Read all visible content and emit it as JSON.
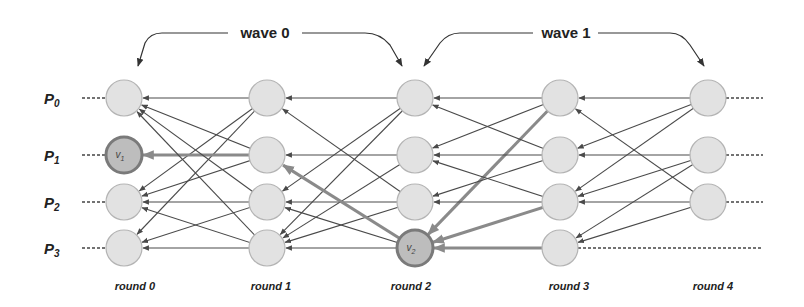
{
  "waves": [
    {
      "label": "wave 0",
      "from_round": 0,
      "to_round": 2
    },
    {
      "label": "wave 1",
      "from_round": 2,
      "to_round": 4
    }
  ],
  "processes": [
    {
      "label": "P",
      "sub": "0"
    },
    {
      "label": "P",
      "sub": "1"
    },
    {
      "label": "P",
      "sub": "2"
    },
    {
      "label": "P",
      "sub": "3"
    }
  ],
  "rounds": [
    {
      "label": "round 0"
    },
    {
      "label": "round 1"
    },
    {
      "label": "round 2"
    },
    {
      "label": "round 3"
    },
    {
      "label": "round 4"
    }
  ],
  "layout": {
    "col_x": [
      124,
      267,
      415,
      560,
      708
    ],
    "row_y": [
      98,
      155,
      202,
      248
    ],
    "radius": 18
  },
  "colors": {
    "node_fill": "#e2e2e2",
    "node_stroke": "#b4b4b4",
    "highlight_fill": "#bdbdbd",
    "highlight_stroke": "#7a7a7a",
    "edge": "#4a4a4a",
    "highlight_edge": "#8a8a8a"
  },
  "nodes": [
    {
      "round": 0,
      "proc": 0
    },
    {
      "round": 0,
      "proc": 1,
      "label": "v",
      "sub": "1",
      "highlight": true
    },
    {
      "round": 0,
      "proc": 2
    },
    {
      "round": 0,
      "proc": 3
    },
    {
      "round": 1,
      "proc": 0
    },
    {
      "round": 1,
      "proc": 1
    },
    {
      "round": 1,
      "proc": 2
    },
    {
      "round": 1,
      "proc": 3
    },
    {
      "round": 2,
      "proc": 0
    },
    {
      "round": 2,
      "proc": 1
    },
    {
      "round": 2,
      "proc": 2
    },
    {
      "round": 2,
      "proc": 3,
      "label": "v",
      "sub": "2",
      "highlight": true
    },
    {
      "round": 3,
      "proc": 0
    },
    {
      "round": 3,
      "proc": 1
    },
    {
      "round": 3,
      "proc": 2
    },
    {
      "round": 3,
      "proc": 3
    },
    {
      "round": 4,
      "proc": 0
    },
    {
      "round": 4,
      "proc": 1
    },
    {
      "round": 4,
      "proc": 2
    }
  ],
  "edges": [
    {
      "from": [
        1,
        0
      ],
      "to": [
        0,
        0
      ]
    },
    {
      "from": [
        1,
        0
      ],
      "to": [
        0,
        2
      ]
    },
    {
      "from": [
        1,
        0
      ],
      "to": [
        0,
        3
      ]
    },
    {
      "from": [
        1,
        1
      ],
      "to": [
        0,
        1
      ],
      "highlight": true
    },
    {
      "from": [
        1,
        1
      ],
      "to": [
        0,
        0
      ]
    },
    {
      "from": [
        1,
        1
      ],
      "to": [
        0,
        2
      ]
    },
    {
      "from": [
        1,
        2
      ],
      "to": [
        0,
        2
      ]
    },
    {
      "from": [
        1,
        2
      ],
      "to": [
        0,
        0
      ]
    },
    {
      "from": [
        1,
        2
      ],
      "to": [
        0,
        3
      ]
    },
    {
      "from": [
        1,
        3
      ],
      "to": [
        0,
        3
      ]
    },
    {
      "from": [
        1,
        3
      ],
      "to": [
        0,
        0
      ]
    },
    {
      "from": [
        1,
        3
      ],
      "to": [
        0,
        2
      ]
    },
    {
      "from": [
        2,
        0
      ],
      "to": [
        1,
        0
      ]
    },
    {
      "from": [
        2,
        0
      ],
      "to": [
        1,
        2
      ]
    },
    {
      "from": [
        2,
        0
      ],
      "to": [
        1,
        3
      ]
    },
    {
      "from": [
        2,
        1
      ],
      "to": [
        1,
        1
      ]
    },
    {
      "from": [
        2,
        1
      ],
      "to": [
        1,
        3
      ]
    },
    {
      "from": [
        2,
        2
      ],
      "to": [
        1,
        2
      ]
    },
    {
      "from": [
        2,
        2
      ],
      "to": [
        1,
        3
      ]
    },
    {
      "from": [
        2,
        2
      ],
      "to": [
        1,
        0
      ]
    },
    {
      "from": [
        2,
        3
      ],
      "to": [
        1,
        3
      ]
    },
    {
      "from": [
        2,
        3
      ],
      "to": [
        1,
        2
      ]
    },
    {
      "from": [
        2,
        3
      ],
      "to": [
        1,
        1
      ],
      "highlight": true
    },
    {
      "from": [
        3,
        0
      ],
      "to": [
        2,
        0
      ]
    },
    {
      "from": [
        3,
        0
      ],
      "to": [
        2,
        1
      ]
    },
    {
      "from": [
        3,
        0
      ],
      "to": [
        2,
        3
      ],
      "highlight": true
    },
    {
      "from": [
        3,
        1
      ],
      "to": [
        2,
        1
      ]
    },
    {
      "from": [
        3,
        1
      ],
      "to": [
        2,
        0
      ]
    },
    {
      "from": [
        3,
        1
      ],
      "to": [
        2,
        2
      ]
    },
    {
      "from": [
        3,
        2
      ],
      "to": [
        2,
        2
      ]
    },
    {
      "from": [
        3,
        2
      ],
      "to": [
        2,
        1
      ]
    },
    {
      "from": [
        3,
        2
      ],
      "to": [
        2,
        3
      ],
      "highlight": true
    },
    {
      "from": [
        3,
        3
      ],
      "to": [
        2,
        3
      ],
      "highlight": true
    },
    {
      "from": [
        4,
        0
      ],
      "to": [
        3,
        0
      ]
    },
    {
      "from": [
        4,
        0
      ],
      "to": [
        3,
        1
      ]
    },
    {
      "from": [
        4,
        0
      ],
      "to": [
        3,
        2
      ]
    },
    {
      "from": [
        4,
        1
      ],
      "to": [
        3,
        1
      ]
    },
    {
      "from": [
        4,
        1
      ],
      "to": [
        3,
        2
      ]
    },
    {
      "from": [
        4,
        1
      ],
      "to": [
        3,
        3
      ]
    },
    {
      "from": [
        4,
        2
      ],
      "to": [
        3,
        2
      ]
    },
    {
      "from": [
        4,
        2
      ],
      "to": [
        3,
        0
      ]
    },
    {
      "from": [
        4,
        2
      ],
      "to": [
        3,
        3
      ]
    }
  ]
}
